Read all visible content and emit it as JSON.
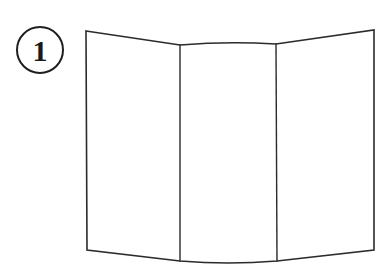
{
  "figure": {
    "kind": "instructional-line-drawing",
    "background_color": "#ffffff",
    "stroke_color": "#2b2b2b",
    "fill_color": "#ffffff",
    "canvas": {
      "width": 388,
      "height": 268
    }
  },
  "step_badge": {
    "label": "1",
    "shape": "circle",
    "center_x": 40,
    "center_y": 50,
    "radius": 23,
    "stroke_color": "#1f1f1f",
    "stroke_width": 2,
    "text_color": "#1a1a1a"
  },
  "paper": {
    "name": "folded-paper",
    "panel_count": 3,
    "stroke_width": 1.6,
    "outline_path": "M 86 31 L 180 45 Q 228 41 276 44 L 374 30 L 374 250 L 277 261 Q 228 265 180 261 L 87 250 Z",
    "fold_lines": [
      {
        "name": "fold-line-left",
        "x1": 180,
        "y1": 45,
        "x2": 180,
        "y2": 261
      },
      {
        "name": "fold-line-right",
        "x1": 276,
        "y1": 44,
        "x2": 277,
        "y2": 261
      }
    ],
    "corners": {
      "top_left": [
        86,
        31
      ],
      "top_right": [
        374,
        30
      ],
      "bottom_right": [
        374,
        250
      ],
      "bottom_left": [
        87,
        250
      ]
    },
    "fold_vertices": {
      "top_left_fold": [
        180,
        45
      ],
      "top_right_fold": [
        276,
        44
      ],
      "bottom_left_fold": [
        180,
        261
      ],
      "bottom_right_fold": [
        277,
        261
      ]
    }
  }
}
